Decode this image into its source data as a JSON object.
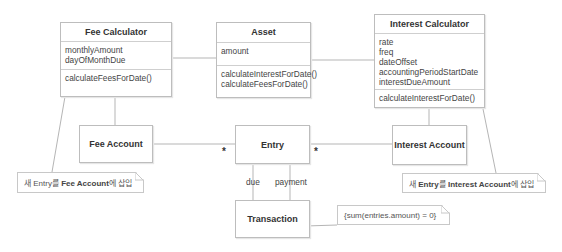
{
  "diagram": {
    "classes": {
      "fee_calculator": {
        "name": "Fee Calculator",
        "attributes": [
          "monthlyAmount",
          "dayOfMonthDue"
        ],
        "operations": [
          "calculateFeesForDate()"
        ]
      },
      "asset": {
        "name": "Asset",
        "attributes": [
          "amount"
        ],
        "operations": [
          "calculateInterestForDate()",
          "calculateFeesForDate()"
        ]
      },
      "interest_calculator": {
        "name": "Interest Calculator",
        "attributes": [
          "rate",
          "freq",
          "dateOffset",
          "accountingPeriodStartDate",
          "interestDueAmount"
        ],
        "operations": [
          "calculateInterestForDate()"
        ]
      },
      "fee_account": {
        "name": "Fee Account"
      },
      "entry": {
        "name": "Entry"
      },
      "interest_account": {
        "name": "Interest Account"
      },
      "transaction": {
        "name": "Transaction"
      }
    },
    "multiplicities": {
      "fee_account_entry": "*",
      "interest_account_entry": "*"
    },
    "roles": {
      "due": "due",
      "payment": "payment"
    },
    "notes": {
      "fee_note_prefix": "새 Entry를 ",
      "fee_note_bold": "Fee Account",
      "fee_note_suffix": "에 삽입",
      "interest_note_prefix": "새 ",
      "interest_note_bold": "Entry",
      "interest_note_mid": "를 ",
      "interest_note_bold2": "Interest Account",
      "interest_note_suffix": "에 삽입",
      "constraint": "{sum(entries.amount) = 0}"
    }
  }
}
